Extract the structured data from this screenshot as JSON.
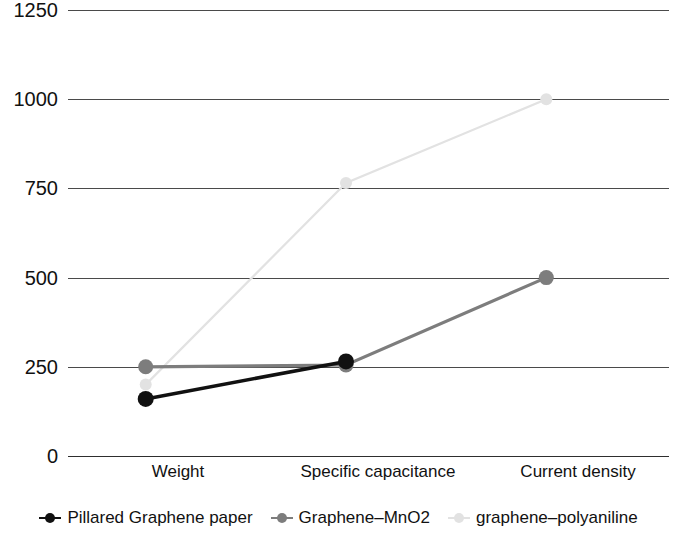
{
  "chart_data": {
    "type": "line",
    "title": "",
    "subtitle": "",
    "xlabel": "",
    "ylabel": "",
    "categories": [
      "Weight",
      "Specific capacitance",
      "Current density"
    ],
    "yticks": [
      0,
      250,
      500,
      750,
      1000,
      1250
    ],
    "ytick_labels": [
      "0",
      "250",
      "500",
      "750",
      "1000",
      "1250"
    ],
    "ylim": [
      0,
      1250
    ],
    "grid": true,
    "legend_position": "bottom",
    "series": [
      {
        "name": "Pillared Graphene paper",
        "color": "#111111",
        "values": [
          160,
          265,
          null
        ]
      },
      {
        "name": "Graphene–MnO2",
        "color": "#7d7d7d",
        "values": [
          250,
          255,
          500
        ]
      },
      {
        "name": "graphene–polyaniline",
        "color": "#e2e2e2",
        "values": [
          200,
          765,
          1000
        ]
      }
    ]
  },
  "axis": {
    "y_tick_0": "0",
    "y_tick_250": "250",
    "y_tick_500": "500",
    "y_tick_750": "750",
    "y_tick_1000": "1000",
    "y_tick_1250": "1250",
    "x_cat_0": "Weight",
    "x_cat_1": "Specific capacitance",
    "x_cat_2": "Current density"
  },
  "legend": {
    "items": [
      {
        "label": "Pillared Graphene paper",
        "color": "#111111"
      },
      {
        "label": "Graphene–MnO2",
        "color": "#7d7d7d"
      },
      {
        "label": "graphene–polyaniline",
        "color": "#e2e2e2"
      }
    ]
  },
  "colors": {
    "background": "#ffffff",
    "gridline": "#4a4a4a",
    "axis": "#2e2e2e",
    "text": "#111111",
    "series_1": "#111111",
    "series_2": "#7d7d7d",
    "series_3": "#e2e2e2"
  }
}
